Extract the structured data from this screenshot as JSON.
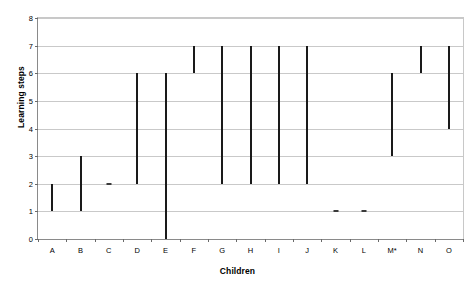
{
  "chart_data": {
    "type": "bar",
    "subtype": "floating-range-bar",
    "title": "",
    "xlabel": "Children",
    "ylabel": "Learning steps",
    "categories": [
      "A",
      "B",
      "C",
      "D",
      "E",
      "F",
      "G",
      "H",
      "I",
      "J",
      "K",
      "L",
      "M*",
      "N",
      "O"
    ],
    "series": [
      {
        "name": "Learning steps range",
        "low": [
          1,
          1,
          2,
          2,
          0,
          6,
          2,
          2,
          2,
          2,
          1,
          1,
          3,
          6,
          4
        ],
        "high": [
          2,
          3,
          2,
          6,
          6,
          7,
          7,
          7,
          7,
          7,
          1,
          1,
          6,
          7,
          7
        ]
      }
    ],
    "ranges": [
      {
        "category": "A",
        "low": 1,
        "high": 2,
        "is_point": false
      },
      {
        "category": "B",
        "low": 1,
        "high": 3,
        "is_point": false
      },
      {
        "category": "C",
        "low": 2,
        "high": 2,
        "is_point": true
      },
      {
        "category": "D",
        "low": 2,
        "high": 6,
        "is_point": false
      },
      {
        "category": "E",
        "low": 0,
        "high": 6,
        "is_point": false
      },
      {
        "category": "F",
        "low": 6,
        "high": 7,
        "is_point": false
      },
      {
        "category": "G",
        "low": 2,
        "high": 7,
        "is_point": false
      },
      {
        "category": "H",
        "low": 2,
        "high": 7,
        "is_point": false
      },
      {
        "category": "I",
        "low": 2,
        "high": 7,
        "is_point": false
      },
      {
        "category": "J",
        "low": 2,
        "high": 7,
        "is_point": false
      },
      {
        "category": "K",
        "low": 1,
        "high": 1,
        "is_point": true
      },
      {
        "category": "L",
        "low": 1,
        "high": 1,
        "is_point": true
      },
      {
        "category": "M*",
        "low": 3,
        "high": 6,
        "is_point": false
      },
      {
        "category": "N",
        "low": 6,
        "high": 7,
        "is_point": false
      },
      {
        "category": "O",
        "low": 4,
        "high": 7,
        "is_point": false
      }
    ],
    "ylim": [
      0,
      8
    ],
    "yticks": [
      0,
      1,
      2,
      3,
      4,
      5,
      6,
      7,
      8
    ],
    "ytick_labels": [
      "0",
      "1",
      "2",
      "3",
      "4",
      "5",
      "6",
      "7",
      "8"
    ],
    "grid": true,
    "grid_axis": "y",
    "legend": false,
    "legend_position": "none",
    "bar_color": "#1a1a1a",
    "grid_color": "#c9c9c9",
    "axis_color": "#8a8a8a",
    "background_color": "#ffffff"
  }
}
